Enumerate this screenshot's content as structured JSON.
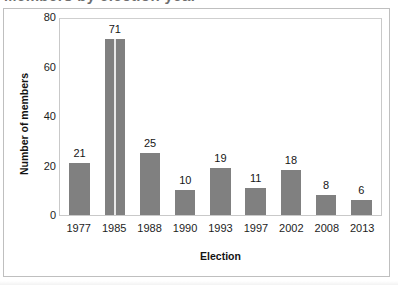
{
  "figure": {
    "clipped_heading_remnant": "Members by election year",
    "background_color": "#ffffff",
    "frame_color": "#bfbfbf",
    "bar_color": "#808080",
    "text_color": "#1a1a1a"
  },
  "chart_data": {
    "type": "bar",
    "title": "",
    "xlabel": "Election",
    "ylabel": "Number of members",
    "categories": [
      "1977",
      "1985",
      "1988",
      "1990",
      "1993",
      "1997",
      "2002",
      "2008",
      "2013"
    ],
    "values": [
      21,
      71,
      25,
      10,
      19,
      11,
      18,
      8,
      6
    ],
    "data_labels": [
      "21",
      "71",
      "25",
      "10",
      "19",
      "11",
      "18",
      "8",
      "6"
    ],
    "ylim": [
      0,
      80
    ],
    "yticks": [
      0,
      20,
      40,
      60,
      80
    ],
    "ytick_labels": [
      "0",
      "20",
      "40",
      "60",
      "80"
    ],
    "grid": false,
    "legend": null,
    "series": [
      {
        "name": "Number of members",
        "color": "#808080",
        "values": [
          21,
          71,
          25,
          10,
          19,
          11,
          18,
          8,
          6
        ]
      }
    ]
  }
}
